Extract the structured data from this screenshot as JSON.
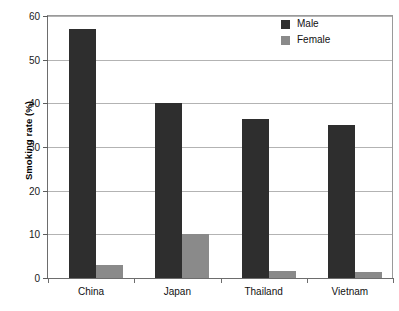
{
  "chart_data": {
    "type": "bar",
    "title": "",
    "xlabel": "",
    "ylabel": "Smoking rate (%)",
    "ylim": [
      0,
      60
    ],
    "yticks": [
      0,
      10,
      20,
      30,
      40,
      50,
      60
    ],
    "ytick_labels": [
      "0",
      "10",
      "20",
      "30",
      "40",
      "50",
      "60"
    ],
    "grid": true,
    "legend_position": "top-right",
    "categories": [
      "China",
      "Japan",
      "Thailand",
      "Vietnam"
    ],
    "series": [
      {
        "name": "Male",
        "color": "#2e2e2e",
        "values": [
          57,
          40,
          36.5,
          35
        ]
      },
      {
        "name": "Female",
        "color": "#8a8a8a",
        "values": [
          3,
          10,
          1.6,
          1.4
        ]
      }
    ]
  },
  "legend": {
    "items": [
      {
        "label": "Male",
        "swatch": "male-swatch"
      },
      {
        "label": "Female",
        "swatch": "female-swatch"
      }
    ]
  }
}
